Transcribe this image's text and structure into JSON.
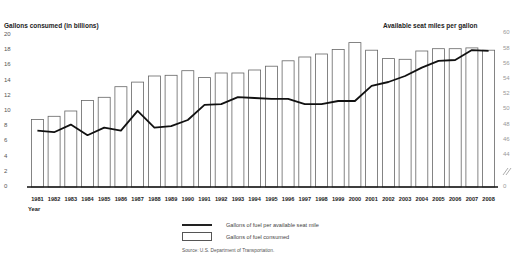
{
  "chart_data": {
    "type": "bar+line",
    "title": "",
    "x": [
      "1981",
      "1982",
      "1983",
      "1984",
      "1985",
      "1986",
      "1987",
      "1988",
      "1989",
      "1990",
      "1991",
      "1992",
      "1993",
      "1994",
      "1995",
      "1996",
      "1997",
      "1998",
      "1999",
      "2000",
      "2001",
      "2002",
      "2003",
      "2004",
      "2005",
      "2006",
      "2007",
      "2008"
    ],
    "xlabel": "Year",
    "ylabel_left": "Gallons consumed",
    "ylabel_left_suffix": "(in billions)",
    "ylabel_right": "Available seat miles per gallon",
    "yticks_left": [
      "0",
      "2",
      "4",
      "6",
      "8",
      "10",
      "12",
      "14",
      "16",
      "18",
      "20"
    ],
    "yticks_right": [
      "0",
      "44",
      "46",
      "48",
      "50",
      "52",
      "54",
      "56",
      "58",
      "60"
    ],
    "ylim_left": [
      0,
      20
    ],
    "ylim_right": [
      44,
      60
    ],
    "right_axis_break": true,
    "grid": false,
    "legend_position": "bottom-center",
    "series": [
      {
        "name": "Gallons of fuel consumed",
        "type": "bar",
        "axis": "left",
        "values": [
          8.9,
          9.3,
          10.0,
          11.4,
          11.8,
          13.2,
          13.8,
          14.6,
          14.7,
          15.3,
          14.4,
          15.0,
          15.0,
          15.4,
          15.9,
          16.6,
          17.1,
          17.5,
          18.1,
          19.0,
          18.0,
          16.9,
          16.8,
          17.9,
          18.2,
          18.2,
          18.3,
          18.0
        ]
      },
      {
        "name": "Gallons of fuel per available seat mile",
        "type": "line",
        "axis": "right",
        "values": [
          47.2,
          47.0,
          48.0,
          46.6,
          47.6,
          47.2,
          49.8,
          47.6,
          47.8,
          48.6,
          50.6,
          50.7,
          51.6,
          51.5,
          51.4,
          51.4,
          50.7,
          50.7,
          51.1,
          51.1,
          53.1,
          53.6,
          54.4,
          55.5,
          56.4,
          56.5,
          57.8,
          57.7
        ]
      }
    ],
    "source": "Source: U.S. Department of Transportation."
  },
  "labels": {
    "left_axis_title": "Gallons consumed",
    "left_axis_suffix": "(in billions)",
    "right_axis_title": "Available seat miles per gallon",
    "x_axis_title": "Year",
    "legend_line": "Gallons of fuel per available seat mile",
    "legend_bar": "Gallons of fuel consumed",
    "source": "Source: U.S. Department of Transportation."
  }
}
